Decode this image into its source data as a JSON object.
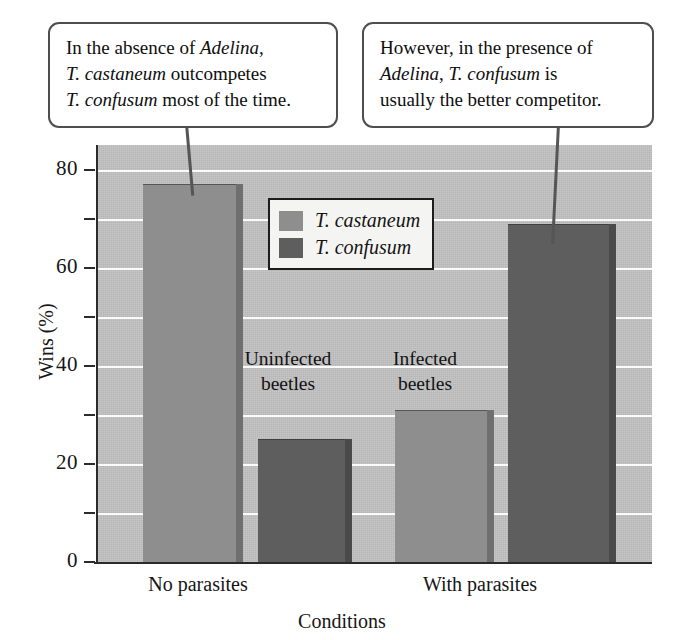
{
  "chart_data": {
    "type": "bar",
    "title": "",
    "xlabel": "Conditions",
    "ylabel": "Wins (%)",
    "ylim": [
      0,
      85
    ],
    "ytick_values": [
      0,
      20,
      40,
      60,
      80
    ],
    "ytick_labels": [
      "0",
      "20",
      "40",
      "60",
      "80"
    ],
    "yminor_values": [
      10,
      30,
      50,
      70
    ],
    "gridlines": [
      10,
      20,
      30,
      40,
      50,
      60,
      70,
      80
    ],
    "grid": true,
    "categories": [
      "No parasites",
      "With parasites"
    ],
    "legend_position": "upper center",
    "series": [
      {
        "name": "T. castaneum",
        "color": "#8e8e8e",
        "values": [
          77,
          31
        ]
      },
      {
        "name": "T. confusum",
        "color": "#5e5e5e",
        "values": [
          25,
          69
        ]
      }
    ],
    "bars": [
      {
        "label": "T. castaneum",
        "group": "No parasites",
        "value": 77,
        "style": "light"
      },
      {
        "label": "T. confusum",
        "group": "No parasites",
        "value": 25,
        "style": "dark"
      },
      {
        "label": "T. castaneum",
        "group": "With parasites",
        "value": 31,
        "style": "light"
      },
      {
        "label": "T. confusum",
        "group": "With parasites",
        "value": 69,
        "style": "dark"
      }
    ],
    "annotations": [
      {
        "text_line1": "Uninfected",
        "text_line2": "beetles"
      },
      {
        "text_line1": "Infected",
        "text_line2": "beetles"
      }
    ]
  },
  "axes": {
    "y_title": "Wins (%)",
    "x_title": "Conditions",
    "y_labels": [
      "80",
      "60",
      "40",
      "20",
      "0"
    ],
    "x_labels": [
      "No parasites",
      "With parasites"
    ]
  },
  "legend": {
    "items": [
      {
        "label": "T. castaneum",
        "color": "#8e8e8e"
      },
      {
        "label": "T. confusum",
        "color": "#5e5e5e"
      }
    ]
  },
  "annotations": {
    "uninfected_line1": "Uninfected",
    "uninfected_line2": "beetles",
    "infected_line1": "Infected",
    "infected_line2": "beetles"
  },
  "callouts": {
    "left": {
      "line1_a": "In the absence of ",
      "line1_b": "Adelina",
      "line1_c": ",",
      "line2_a": "T. castaneum",
      "line2_b": " outcompetes",
      "line3_a": "T. confusum",
      "line3_b": " most of the time."
    },
    "right": {
      "line1": "However, in the presence of",
      "line2_a": "Adelina",
      "line2_b": ", ",
      "line2_c": "T. confusum",
      "line2_d": " is",
      "line3": "usually the better competitor."
    }
  }
}
